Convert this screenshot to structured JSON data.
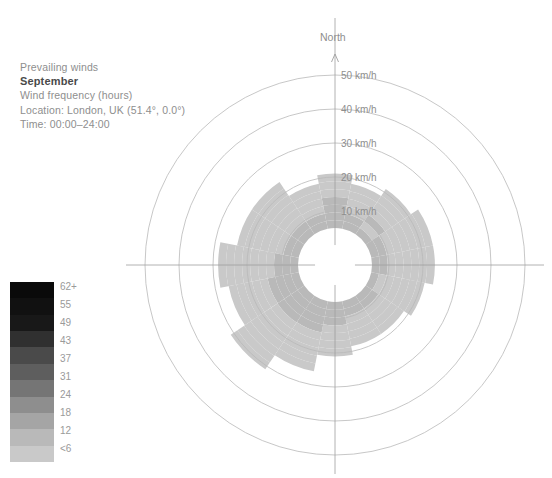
{
  "caption": {
    "line1": "Prevailing winds",
    "month": "September",
    "line3": "Wind frequency (hours)",
    "line4": "Location: London, UK (51.4°, 0.0°)",
    "line5": "Time: 00:00–24:00"
  },
  "north": {
    "label": "North",
    "arrow_icon": "north-arrow-icon"
  },
  "legend": {
    "title": "Wind frequency (hours)",
    "labels": [
      "62+",
      "55",
      "49",
      "43",
      "37",
      "31",
      "24",
      "18",
      "12",
      "<6"
    ],
    "colors": [
      "#0a0a0a",
      "#111111",
      "#181818",
      "#303030",
      "#4a4a4a",
      "#5e5e5e",
      "#757575",
      "#8e8e8e",
      "#a5a5a5",
      "#b9b9b9",
      "#c9c9c9"
    ]
  },
  "rings": {
    "labels": [
      "10 km/h",
      "20 km/h",
      "30 km/h",
      "40 km/h",
      "50 km/h"
    ],
    "values": [
      10,
      20,
      30,
      40,
      50
    ]
  },
  "chart_data": {
    "type": "windrose",
    "subtitle": "Wind frequency (hours)",
    "location": "London, UK (51.4°, 0.0°)",
    "time": "00:00–24:00",
    "radial_unit": "km/h",
    "radial_ticks": [
      10,
      20,
      30,
      40,
      50
    ],
    "rmax": 55,
    "color_scale_label": "Wind frequency (hours)",
    "color_bins": [
      "<6",
      "12",
      "18",
      "24",
      "31",
      "37",
      "43",
      "49",
      "55",
      "62+"
    ],
    "color_bin_hex": [
      "#c9c9c9",
      "#b9b9b9",
      "#a5a5a5",
      "#8e8e8e",
      "#757575",
      "#5e5e5e",
      "#4a4a4a",
      "#303030",
      "#181818",
      "#0a0a0a"
    ],
    "directions": [
      "N",
      "NNE",
      "NE",
      "ENE",
      "E",
      "ESE",
      "SE",
      "SSE",
      "S",
      "SSW",
      "SW",
      "WSW",
      "W",
      "WNW",
      "NW",
      "NNW"
    ],
    "sector_count": 16,
    "band_speed_step": 2.75,
    "hub_radius_kmh": 5,
    "series": [
      {
        "direction": "N",
        "angle_deg": 0,
        "extent_kmh": 21.0,
        "bins": [
          7,
          7,
          6,
          6,
          4,
          4,
          3
        ]
      },
      {
        "direction": "NNE",
        "angle_deg": 22.5,
        "extent_kmh": 18.5,
        "bins": [
          6,
          6,
          5,
          4,
          3,
          3
        ]
      },
      {
        "direction": "NE",
        "angle_deg": 45,
        "extent_kmh": 21.0,
        "bins": [
          6,
          5,
          9,
          5,
          4,
          3,
          3
        ]
      },
      {
        "direction": "ENE",
        "angle_deg": 67.5,
        "extent_kmh": 23.5,
        "bins": [
          6,
          6,
          5,
          5,
          4,
          3,
          2,
          2
        ]
      },
      {
        "direction": "E",
        "angle_deg": 90,
        "extent_kmh": 23.5,
        "bins": [
          6,
          6,
          5,
          5,
          3,
          3,
          2,
          2
        ]
      },
      {
        "direction": "ESE",
        "angle_deg": 112.5,
        "extent_kmh": 21.0,
        "bins": [
          6,
          5,
          5,
          4,
          3,
          2,
          2
        ]
      },
      {
        "direction": "SE",
        "angle_deg": 135,
        "extent_kmh": 18.5,
        "bins": [
          6,
          6,
          5,
          4,
          3,
          2
        ]
      },
      {
        "direction": "SSE",
        "angle_deg": 157.5,
        "extent_kmh": 18.5,
        "bins": [
          7,
          6,
          5,
          4,
          3,
          2
        ]
      },
      {
        "direction": "S",
        "angle_deg": 180,
        "extent_kmh": 21.0,
        "bins": [
          8,
          7,
          6,
          5,
          4,
          3,
          2
        ]
      },
      {
        "direction": "SSW",
        "angle_deg": 202.5,
        "extent_kmh": 26.0,
        "bins": [
          10,
          8,
          7,
          6,
          4,
          3,
          2,
          2,
          1
        ]
      },
      {
        "direction": "SW",
        "angle_deg": 225,
        "extent_kmh": 31.0,
        "bins": [
          10,
          9,
          8,
          7,
          5,
          4,
          3,
          2,
          2,
          1,
          1
        ]
      },
      {
        "direction": "WSW",
        "angle_deg": 247.5,
        "extent_kmh": 26.0,
        "bins": [
          8,
          8,
          7,
          6,
          4,
          3,
          2,
          1,
          1
        ]
      },
      {
        "direction": "W",
        "angle_deg": 270,
        "extent_kmh": 28.5,
        "bins": [
          7,
          6,
          6,
          5,
          3,
          2,
          2,
          1,
          1,
          1
        ]
      },
      {
        "direction": "WNW",
        "angle_deg": 292.5,
        "extent_kmh": 23.5,
        "bins": [
          7,
          6,
          5,
          5,
          3,
          2,
          2,
          1
        ]
      },
      {
        "direction": "NW",
        "angle_deg": 315,
        "extent_kmh": 23.5,
        "bins": [
          7,
          6,
          5,
          4,
          3,
          2,
          2,
          1
        ]
      },
      {
        "direction": "NNW",
        "angle_deg": 337.5,
        "extent_kmh": 18.5,
        "bins": [
          6,
          6,
          5,
          4,
          3,
          2
        ]
      }
    ]
  },
  "geometry": {
    "center_x": 335,
    "center_y": 265,
    "outer_radius_px": 207,
    "hub_radius_px": 20
  }
}
